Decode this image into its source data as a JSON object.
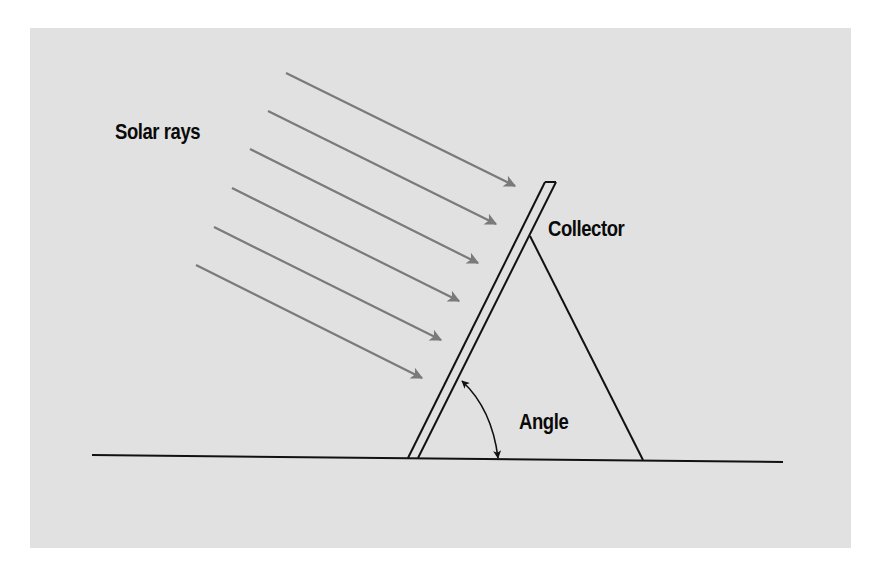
{
  "diagram": {
    "labels": {
      "solar_rays": "Solar rays",
      "collector": "Collector",
      "angle": "Angle"
    },
    "colors": {
      "background_panel": "#e1e1e1",
      "ray_color": "#7a7a7a",
      "line_color": "#111111",
      "text_color": "#0a0a0a"
    },
    "rays": [
      {
        "x1": 286,
        "y1": 73,
        "x2": 515,
        "y2": 186
      },
      {
        "x1": 268,
        "y1": 111,
        "x2": 496,
        "y2": 224
      },
      {
        "x1": 250,
        "y1": 149,
        "x2": 478,
        "y2": 263
      },
      {
        "x1": 232,
        "y1": 188,
        "x2": 459,
        "y2": 301
      },
      {
        "x1": 214,
        "y1": 227,
        "x2": 441,
        "y2": 340
      },
      {
        "x1": 196,
        "y1": 265,
        "x2": 422,
        "y2": 378
      }
    ],
    "ground_line": {
      "x1": 92,
      "y1": 455,
      "x2": 783,
      "y2": 462
    },
    "collector_panel": {
      "outer": {
        "x1": 408,
        "y1": 458,
        "x2": 545,
        "y2": 182
      },
      "inner": {
        "x1": 418,
        "y1": 458,
        "x2": 556,
        "y2": 182
      }
    },
    "support_triangle": {
      "apex": {
        "x": 530,
        "y": 236
      },
      "right_foot": {
        "x": 643,
        "y": 460
      }
    },
    "angle_arc": {
      "start": {
        "x": 462,
        "y": 381
      },
      "end": {
        "x": 498,
        "y": 458
      }
    }
  }
}
